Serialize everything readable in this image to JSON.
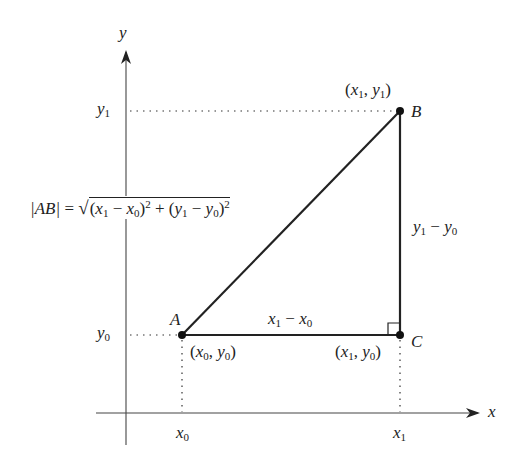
{
  "diagram": {
    "axes": {
      "x_label": "x",
      "y_label": "y",
      "x_ticks": [
        {
          "main": "x",
          "sub": "0"
        },
        {
          "main": "x",
          "sub": "1"
        }
      ],
      "y_ticks": [
        {
          "main": "y",
          "sub": "0"
        },
        {
          "main": "y",
          "sub": "1"
        }
      ]
    },
    "points": {
      "A": {
        "name": "A",
        "coord_label": "(x0, y0)",
        "x": "x",
        "xs": "0",
        "y": "y",
        "ys": "0"
      },
      "B": {
        "name": "B",
        "coord_label": "(x1, y1)",
        "x": "x",
        "xs": "1",
        "y": "y",
        "ys": "1"
      },
      "C": {
        "name": "C",
        "coord_label": "(x1, y0)",
        "x": "x",
        "xs": "1",
        "y": "y",
        "ys": "0"
      }
    },
    "sides": {
      "horizontal": {
        "a": "x",
        "as": "1",
        "op": "−",
        "b": "x",
        "bs": "0",
        "text": "x1 − x0"
      },
      "vertical": {
        "a": "y",
        "as": "1",
        "op": "−",
        "b": "y",
        "bs": "0",
        "text": "y1 − y0"
      }
    },
    "formula": {
      "lhs": "|AB|",
      "eq": "=",
      "text": "|AB| = √((x1 − x0)² + (y1 − y0)²)",
      "x1": "x",
      "x1s": "1",
      "x0": "x",
      "x0s": "0",
      "y1": "y",
      "y1s": "1",
      "y0": "y",
      "y0s": "0",
      "minus": "−",
      "plus": "+",
      "exp": "2",
      "lparen": "(",
      "rparen": ")"
    },
    "right_angle_marker": "C",
    "colors": {
      "stroke": "#222222",
      "axis": "#333333",
      "background": "#ffffff"
    }
  }
}
